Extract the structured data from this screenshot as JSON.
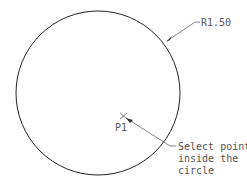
{
  "diagram": {
    "circle": {
      "cx": 98,
      "cy": 93,
      "r": 82,
      "stroke": "#222222"
    },
    "radius_label": "R1.50",
    "point_label": "P1",
    "callout": [
      "Select point",
      "inside the",
      "circle"
    ],
    "leader_color": "#666666"
  }
}
